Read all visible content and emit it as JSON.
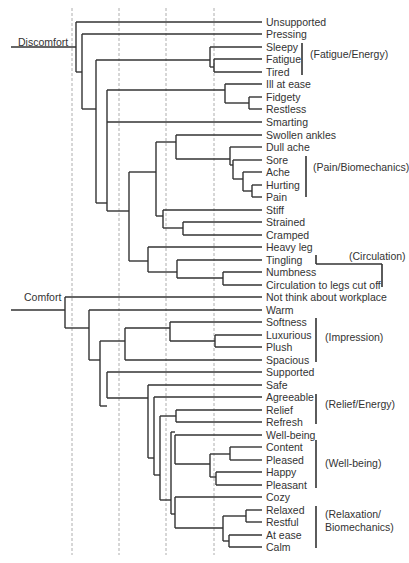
{
  "diagram": {
    "type": "dendrogram",
    "guides_x": [
      72,
      119,
      166,
      214
    ],
    "leaf_x": 262,
    "roots": [
      {
        "label": "Discomfort",
        "label_x": 18,
        "label_y": 36,
        "line_y": 47,
        "line_x0": 11,
        "line_x1": 76
      },
      {
        "label": "Comfort",
        "label_x": 24,
        "label_y": 291,
        "line_y": 310,
        "line_x0": 11,
        "line_x1": 65
      }
    ],
    "leaves": [
      {
        "label": "Unsupported",
        "y": 22
      },
      {
        "label": "Pressing",
        "y": 34
      },
      {
        "label": "Sleepy",
        "y": 47
      },
      {
        "label": "Fatigue",
        "y": 59
      },
      {
        "label": "Tired",
        "y": 72
      },
      {
        "label": "Ill at ease",
        "y": 84
      },
      {
        "label": "Fidgety",
        "y": 97
      },
      {
        "label": "Restless",
        "y": 109
      },
      {
        "label": "Smarting",
        "y": 122
      },
      {
        "label": "Swollen ankles",
        "y": 135
      },
      {
        "label": "Dull ache",
        "y": 147
      },
      {
        "label": "Sore",
        "y": 160
      },
      {
        "label": "Ache",
        "y": 172
      },
      {
        "label": "Hurting",
        "y": 185
      },
      {
        "label": "Pain",
        "y": 197
      },
      {
        "label": "Stiff",
        "y": 210
      },
      {
        "label": "Strained",
        "y": 222
      },
      {
        "label": "Cramped",
        "y": 235
      },
      {
        "label": "Heavy leg",
        "y": 247
      },
      {
        "label": "Tingling",
        "y": 260
      },
      {
        "label": "Numbness",
        "y": 272
      },
      {
        "label": "Circulation to legs cut off",
        "y": 285
      },
      {
        "label": "Not think about workplace",
        "y": 297
      },
      {
        "label": "Warm",
        "y": 310
      },
      {
        "label": "Softness",
        "y": 322
      },
      {
        "label": "Luxurious",
        "y": 335
      },
      {
        "label": "Plush",
        "y": 347
      },
      {
        "label": "Spacious",
        "y": 360
      },
      {
        "label": "Supported",
        "y": 372
      },
      {
        "label": "Safe",
        "y": 385
      },
      {
        "label": "Agreeable",
        "y": 397
      },
      {
        "label": "Relief",
        "y": 410
      },
      {
        "label": "Refresh",
        "y": 422
      },
      {
        "label": "Well-being",
        "y": 435
      },
      {
        "label": "Content",
        "y": 447
      },
      {
        "label": "Pleased",
        "y": 460
      },
      {
        "label": "Happy",
        "y": 472
      },
      {
        "label": "Pleasant",
        "y": 485
      },
      {
        "label": "Cozy",
        "y": 497
      },
      {
        "label": "Relaxed",
        "y": 510
      },
      {
        "label": "Restful",
        "y": 522
      },
      {
        "label": "At ease",
        "y": 535
      },
      {
        "label": "Calm",
        "y": 547
      }
    ],
    "groups": [
      {
        "label": "(Fatigue/Energy)",
        "bar_x": 302,
        "y0": 43,
        "y1": 75,
        "text_x": 310,
        "text_y": 54
      },
      {
        "label": "(Pain/Biomechanics)",
        "bar_x": 306,
        "y0": 156,
        "y1": 197,
        "text_x": 313,
        "text_y": 167
      },
      {
        "label": "(Circulation)",
        "text_x": 349,
        "text_y": 256
      },
      {
        "label": "(Impression)",
        "bar_x": 316,
        "y0": 318,
        "y1": 362,
        "text_x": 325,
        "text_y": 337
      },
      {
        "label": "(Relief/Energy)",
        "bar_x": 316,
        "y0": 394,
        "y1": 424,
        "text_x": 325,
        "text_y": 404
      },
      {
        "label": "(Well-being)",
        "bar_x": 316,
        "y0": 440,
        "y1": 488,
        "text_x": 325,
        "text_y": 463
      },
      {
        "label": "(Relaxation/",
        "bar_x": 316,
        "y0": 506,
        "y1": 548,
        "text_x": 325,
        "text_y": 514
      },
      {
        "label": "Biomechanics)",
        "text_x": 325,
        "text_y": 527
      }
    ],
    "circulation_bracket": {
      "x0": 316,
      "y0": 255,
      "ymid": 264,
      "x1": 382,
      "y1": 287
    },
    "links": [
      [
        76,
        22,
        76,
        72
      ],
      [
        76,
        22,
        262,
        22
      ],
      [
        76,
        72,
        82,
        72
      ],
      [
        82,
        34,
        82,
        109
      ],
      [
        82,
        34,
        262,
        34
      ],
      [
        82,
        109,
        96,
        109
      ],
      [
        96,
        60,
        96,
        203
      ],
      [
        96,
        60,
        210,
        60
      ],
      [
        96,
        203,
        107,
        203
      ],
      [
        210,
        47,
        210,
        67
      ],
      [
        210,
        47,
        262,
        47
      ],
      [
        210,
        67,
        214,
        67
      ],
      [
        214,
        59,
        214,
        72
      ],
      [
        214,
        59,
        262,
        59
      ],
      [
        214,
        72,
        262,
        72
      ],
      [
        107,
        90,
        107,
        211
      ],
      [
        107,
        90,
        225,
        90
      ],
      [
        107,
        122,
        262,
        122
      ],
      [
        107,
        211,
        129,
        211
      ],
      [
        225,
        84,
        225,
        103
      ],
      [
        225,
        84,
        262,
        84
      ],
      [
        225,
        103,
        249,
        103
      ],
      [
        249,
        97,
        249,
        109
      ],
      [
        249,
        97,
        262,
        97
      ],
      [
        249,
        109,
        262,
        109
      ],
      [
        129,
        172,
        129,
        261
      ],
      [
        129,
        172,
        156,
        172
      ],
      [
        129,
        261,
        148,
        261
      ],
      [
        156,
        142,
        156,
        216
      ],
      [
        156,
        142,
        176,
        142
      ],
      [
        156,
        216,
        163,
        216
      ],
      [
        176,
        135,
        176,
        159
      ],
      [
        176,
        135,
        262,
        135
      ],
      [
        176,
        159,
        230,
        159
      ],
      [
        230,
        147,
        230,
        165
      ],
      [
        230,
        147,
        262,
        147
      ],
      [
        230,
        165,
        233,
        165
      ],
      [
        233,
        160,
        233,
        179
      ],
      [
        233,
        160,
        262,
        160
      ],
      [
        233,
        179,
        243,
        179
      ],
      [
        243,
        172,
        243,
        191
      ],
      [
        243,
        172,
        262,
        172
      ],
      [
        243,
        191,
        252,
        191
      ],
      [
        252,
        185,
        252,
        197
      ],
      [
        252,
        185,
        262,
        185
      ],
      [
        252,
        197,
        262,
        197
      ],
      [
        163,
        210,
        163,
        228
      ],
      [
        163,
        210,
        262,
        210
      ],
      [
        163,
        228,
        183,
        228
      ],
      [
        183,
        222,
        183,
        235
      ],
      [
        183,
        222,
        262,
        222
      ],
      [
        183,
        235,
        262,
        235
      ],
      [
        148,
        247,
        148,
        272
      ],
      [
        148,
        247,
        262,
        247
      ],
      [
        148,
        272,
        177,
        272
      ],
      [
        177,
        260,
        177,
        278
      ],
      [
        177,
        260,
        262,
        260
      ],
      [
        177,
        278,
        223,
        278
      ],
      [
        223,
        272,
        223,
        285
      ],
      [
        223,
        272,
        262,
        272
      ],
      [
        223,
        285,
        262,
        285
      ],
      [
        65,
        297,
        65,
        328
      ],
      [
        65,
        297,
        262,
        297
      ],
      [
        65,
        328,
        89,
        328
      ],
      [
        89,
        310,
        89,
        360
      ],
      [
        89,
        310,
        262,
        310
      ],
      [
        89,
        360,
        100,
        360
      ],
      [
        100,
        341,
        100,
        406
      ],
      [
        100,
        341,
        125,
        341
      ],
      [
        100,
        406,
        107,
        406
      ],
      [
        125,
        328,
        125,
        360
      ],
      [
        125,
        328,
        170,
        328
      ],
      [
        125,
        360,
        262,
        360
      ],
      [
        170,
        322,
        170,
        341
      ],
      [
        170,
        322,
        262,
        322
      ],
      [
        170,
        341,
        215,
        341
      ],
      [
        215,
        335,
        215,
        347
      ],
      [
        215,
        335,
        262,
        335
      ],
      [
        215,
        347,
        262,
        347
      ],
      [
        107,
        372,
        107,
        398
      ],
      [
        107,
        372,
        262,
        372
      ],
      [
        107,
        398,
        148,
        398
      ],
      [
        148,
        385,
        148,
        458
      ],
      [
        148,
        385,
        262,
        385
      ],
      [
        148,
        458,
        154,
        458
      ],
      [
        154,
        397,
        154,
        475
      ],
      [
        154,
        397,
        262,
        397
      ],
      [
        154,
        475,
        160,
        475
      ],
      [
        160,
        416,
        160,
        500
      ],
      [
        160,
        416,
        176,
        416
      ],
      [
        160,
        500,
        171,
        500
      ],
      [
        176,
        410,
        176,
        422
      ],
      [
        176,
        410,
        262,
        410
      ],
      [
        176,
        422,
        262,
        422
      ],
      [
        171,
        432,
        171,
        514
      ],
      [
        171,
        432,
        175,
        432
      ],
      [
        171,
        514,
        175,
        514
      ],
      [
        175,
        435,
        175,
        464
      ],
      [
        175,
        435,
        262,
        435
      ],
      [
        175,
        464,
        210,
        464
      ],
      [
        210,
        454,
        210,
        477
      ],
      [
        210,
        454,
        230,
        454
      ],
      [
        210,
        477,
        216,
        477
      ],
      [
        230,
        447,
        230,
        460
      ],
      [
        230,
        447,
        262,
        447
      ],
      [
        230,
        460,
        262,
        460
      ],
      [
        216,
        472,
        216,
        485
      ],
      [
        216,
        472,
        262,
        472
      ],
      [
        216,
        485,
        262,
        485
      ],
      [
        175,
        497,
        175,
        528
      ],
      [
        175,
        497,
        262,
        497
      ],
      [
        175,
        528,
        223,
        528
      ],
      [
        223,
        516,
        223,
        541
      ],
      [
        223,
        516,
        246,
        516
      ],
      [
        223,
        541,
        229,
        541
      ],
      [
        246,
        510,
        246,
        522
      ],
      [
        246,
        510,
        262,
        510
      ],
      [
        246,
        522,
        262,
        522
      ],
      [
        229,
        535,
        229,
        547
      ],
      [
        229,
        535,
        262,
        535
      ],
      [
        229,
        547,
        262,
        547
      ]
    ]
  }
}
